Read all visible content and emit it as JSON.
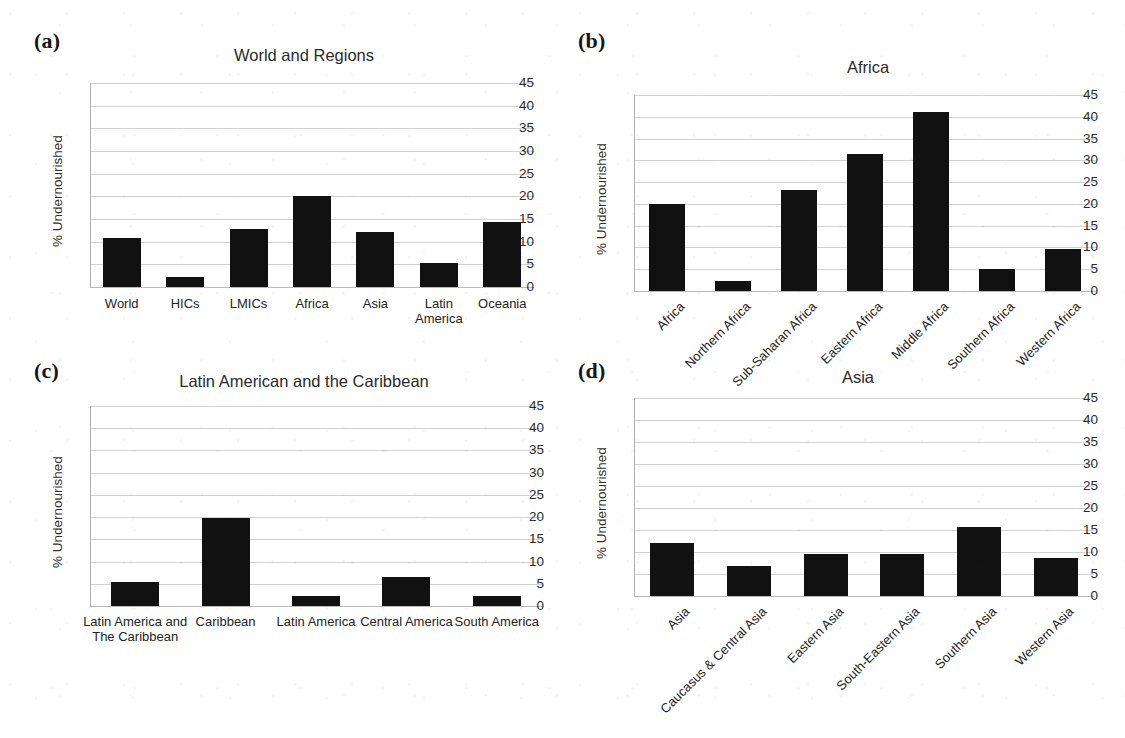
{
  "figure": {
    "ylabel": "% Undernourished",
    "yticks": [
      "45",
      "40",
      "35",
      "30",
      "25",
      "20",
      "15",
      "10",
      "5",
      "0"
    ],
    "ylim": [
      0,
      45
    ],
    "bar_color": "#111111",
    "grid_color": "#d2d2d2"
  },
  "panels": [
    {
      "tag": "(a)",
      "chart_data": {
        "type": "bar",
        "title": "World and Regions",
        "xlabel": "",
        "ylabel": "% Undernourished",
        "ylim": [
          0,
          45
        ],
        "yticks": [
          0,
          5,
          10,
          15,
          20,
          25,
          30,
          35,
          40,
          45
        ],
        "grid": true,
        "legend": "none",
        "label_rotation": 0,
        "categories": [
          "World",
          "HICs",
          "LMICs",
          "Africa",
          "Asia",
          "Latin\nAmerica",
          "Oceania"
        ],
        "values": [
          10.8,
          2.3,
          12.8,
          20.0,
          12.1,
          5.4,
          14.3
        ]
      }
    },
    {
      "tag": "(b)",
      "chart_data": {
        "type": "bar",
        "title": "Africa",
        "xlabel": "",
        "ylabel": "% Undernourished",
        "ylim": [
          0,
          45
        ],
        "yticks": [
          0,
          5,
          10,
          15,
          20,
          25,
          30,
          35,
          40,
          45
        ],
        "grid": true,
        "legend": "none",
        "label_rotation": 45,
        "categories": [
          "Africa",
          "Northern Africa",
          "Sub-Saharan Africa",
          "Eastern Africa",
          "Middle Africa",
          "Southern Africa",
          "Western Africa"
        ],
        "values": [
          20.0,
          2.4,
          23.2,
          31.5,
          41.2,
          5.1,
          9.6
        ]
      }
    },
    {
      "tag": "(c)",
      "chart_data": {
        "type": "bar",
        "title": "Latin American and the Caribbean",
        "xlabel": "",
        "ylabel": "% Undernourished",
        "ylim": [
          0,
          45
        ],
        "yticks": [
          0,
          5,
          10,
          15,
          20,
          25,
          30,
          35,
          40,
          45
        ],
        "grid": true,
        "legend": "none",
        "label_rotation": 0,
        "categories": [
          "Latin America and\nThe Caribbean",
          "Caribbean",
          "Latin America",
          "Central America",
          "South America"
        ],
        "values": [
          5.4,
          19.7,
          2.3,
          6.5,
          2.2
        ]
      }
    },
    {
      "tag": "(d)",
      "chart_data": {
        "type": "bar",
        "title": "Asia",
        "xlabel": "",
        "ylabel": "% Undernourished",
        "ylim": [
          0,
          45
        ],
        "yticks": [
          0,
          5,
          10,
          15,
          20,
          25,
          30,
          35,
          40,
          45
        ],
        "grid": true,
        "legend": "none",
        "label_rotation": 45,
        "categories": [
          "Asia",
          "Caucasus & Central Asia",
          "Eastern Asia",
          "South-Eastern Asia",
          "Southern Asia",
          "Western Asia"
        ],
        "values": [
          12.1,
          6.9,
          9.6,
          9.6,
          15.7,
          8.6
        ]
      }
    }
  ]
}
